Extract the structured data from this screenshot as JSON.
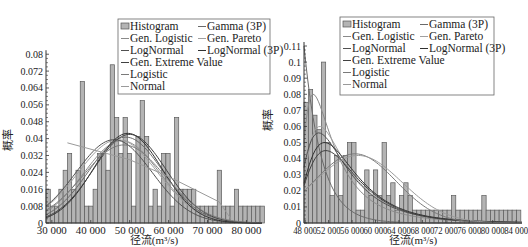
{
  "chart_data": [
    {
      "type": "bar",
      "title": "",
      "xlabel": "径流(m³/s)",
      "ylabel": "概率",
      "xlim": [
        28500,
        84000
      ],
      "ylim": [
        0,
        0.082
      ],
      "xticks": [
        30000,
        40000,
        50000,
        60000,
        70000,
        80000
      ],
      "xtick_labels": [
        "30 000",
        "40 000",
        "50 000",
        "60 000",
        "70 000",
        "80 000"
      ],
      "yticks": [
        0,
        0.008,
        0.016,
        0.024,
        0.032,
        0.04,
        0.048,
        0.056,
        0.064,
        0.072,
        0.08
      ],
      "ytick_labels": [
        "0",
        "0.008",
        "0.016",
        "0.024",
        "0.032",
        "0.04",
        "0.048",
        "0.056",
        "0.064",
        "0.072",
        "0.08"
      ],
      "legend": {
        "placement": "top-right",
        "entries": [
          "Histogram",
          "Gamma (3P)",
          "Gen. Logistic",
          "Gen. Pareto",
          "LogNormal",
          "LogNormal (3P)",
          "Gen. Extreme Value",
          "Logistic",
          "Normal"
        ]
      },
      "histogram": {
        "bin_start": 28500,
        "bin_width": 1100,
        "values": [
          0.016,
          0.008,
          0.008,
          0.016,
          0.025,
          0.033,
          0.016,
          0.025,
          0.067,
          0.008,
          0.008,
          0.016,
          0.033,
          0.033,
          0.025,
          0.075,
          0.05,
          0.033,
          0.05,
          0.033,
          0.008,
          0.041,
          0.058,
          0.041,
          0.008,
          0.016,
          0.008,
          0.033,
          0.033,
          0.008,
          0.05,
          0.016,
          0.016,
          0.016,
          0.016,
          0.008,
          0.008,
          0.008,
          0.008,
          0.008,
          0.025,
          0.008,
          0.008,
          0.008,
          0.016,
          0.008,
          0.008,
          0.008,
          0.008,
          0.008,
          0.008
        ]
      },
      "series": [
        {
          "name": "Gamma (3P)",
          "dist": "normal",
          "mu": 49000,
          "sigma": 9500,
          "scale": 0.0407
        },
        {
          "name": "Gen. Logistic",
          "dist": "normal",
          "mu": 48000,
          "sigma": 9800,
          "scale": 0.039
        },
        {
          "name": "LogNormal",
          "dist": "normal",
          "mu": 47000,
          "sigma": 10200,
          "scale": 0.0395
        },
        {
          "name": "Gen. Extreme Value",
          "dist": "normal",
          "mu": 46000,
          "sigma": 9800,
          "scale": 0.0395
        },
        {
          "name": "Logistic",
          "dist": "normal",
          "mu": 49500,
          "sigma": 8800,
          "scale": 0.0425
        },
        {
          "name": "Normal",
          "dist": "normal",
          "mu": 50000,
          "sigma": 9300,
          "scale": 0.042
        },
        {
          "name": "LogNormal (3P)",
          "dist": "normal",
          "mu": 48500,
          "sigma": 10500,
          "scale": 0.037
        },
        {
          "name": "Gen. Pareto",
          "dist": "line",
          "points": [
            [
              34000,
              0.038
            ],
            [
              50000,
              0.03
            ],
            [
              60000,
              0.022
            ],
            [
              73000,
              0.01
            ],
            [
              76000,
              0.002
            ]
          ]
        }
      ]
    },
    {
      "type": "bar",
      "title": "",
      "xlabel": "径流(m³/s)",
      "ylabel": "概率",
      "xlim": [
        47800,
        85000
      ],
      "ylim": [
        0,
        0.11
      ],
      "xticks": [
        48000,
        52000,
        56000,
        60000,
        64000,
        68000,
        72000,
        76000,
        80000,
        84000
      ],
      "xtick_labels": [
        "48 000",
        "52 000",
        "56 000",
        "60 000",
        "64 000",
        "68 000",
        "72 000",
        "76 000",
        "80 000",
        "84 000"
      ],
      "yticks": [
        0,
        0.01,
        0.02,
        0.03,
        0.04,
        0.05,
        0.06,
        0.07,
        0.08,
        0.09,
        0.1,
        0.11
      ],
      "ytick_labels": [
        "0",
        "0.01",
        "0.02",
        "0.03",
        "0.04",
        "0.05",
        "0.06",
        "0.07",
        "0.08",
        "0.09",
        "0.1",
        "0.11"
      ],
      "legend": {
        "placement": "top-right",
        "entries": [
          "Histogram",
          "Gamma (3P)",
          "Gen. Logistic",
          "Gen. Pareto",
          "LogNormal",
          "LogNormal (3P)",
          "Gen. Extreme Value",
          "Logistic",
          "Normal"
        ]
      },
      "histogram": {
        "bin_start": 47800,
        "bin_width": 740,
        "values": [
          0.075,
          0.083,
          0.067,
          0.058,
          0.1,
          0.05,
          0.017,
          0.042,
          0.017,
          0.042,
          0.05,
          0.05,
          0.008,
          0.008,
          0.033,
          0.017,
          0.033,
          0.017,
          0.05,
          0.017,
          0.025,
          0.008,
          0.017,
          0.025,
          0.017,
          0.008,
          0.008,
          0.008,
          0.008,
          0.008,
          0.008,
          0.008,
          0.008,
          0.008,
          0.017,
          0.008,
          0.008,
          0.008,
          0.008,
          0.008,
          0.008,
          0.017,
          0.008,
          0.008,
          0.008,
          0.008,
          0.008,
          0.008,
          0.008,
          0.008
        ]
      },
      "series": [
        {
          "name": "Gen. Pareto",
          "dist": "exp",
          "x0": 47800,
          "peak": 0.11,
          "decay": 3000
        },
        {
          "name": "LogNormal (3P)",
          "dist": "lognorm",
          "shift": 46500,
          "mu": 8.6,
          "sigma": 0.8,
          "peak_scale": 0.08
        },
        {
          "name": "Gamma (3P)",
          "dist": "lognorm",
          "shift": 46000,
          "mu": 8.9,
          "sigma": 0.7,
          "peak_scale": 0.06
        },
        {
          "name": "Gen. Logistic",
          "dist": "lognorm",
          "shift": 45000,
          "mu": 9.0,
          "sigma": 0.65,
          "peak_scale": 0.056
        },
        {
          "name": "LogNormal",
          "dist": "lognorm",
          "shift": 44000,
          "mu": 9.2,
          "sigma": 0.55,
          "peak_scale": 0.05
        },
        {
          "name": "Gen. Extreme Value",
          "dist": "lognorm",
          "shift": 43000,
          "mu": 9.3,
          "sigma": 0.5,
          "peak_scale": 0.045
        },
        {
          "name": "Logistic",
          "dist": "normal",
          "mu": 56500,
          "sigma": 7000,
          "scale": 0.043
        },
        {
          "name": "Normal",
          "dist": "normal",
          "mu": 57000,
          "sigma": 7500,
          "scale": 0.042
        }
      ]
    }
  ]
}
